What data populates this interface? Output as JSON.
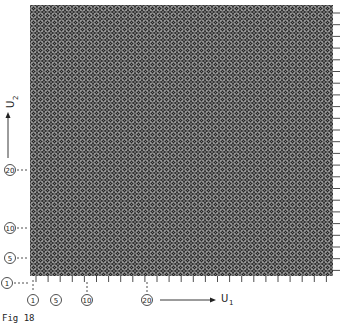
{
  "figure": {
    "caption": "Fig 18",
    "x_axis_label": "U",
    "x_axis_sub": "1",
    "y_axis_label": "U",
    "y_axis_sub": "2",
    "x_ticks_labeled": [
      "1",
      "5",
      "10",
      "20"
    ],
    "y_ticks_labeled": [
      "1",
      "5",
      "10",
      "20"
    ],
    "grid": {
      "left": 30,
      "top": 5,
      "right": 333,
      "bottom": 276,
      "cell": 7
    },
    "colors": {
      "ink": "#1a1a1a",
      "mesh_dark": "#2a2a2a",
      "mesh_light": "#bdbdbd",
      "background": "#ffffff"
    }
  }
}
